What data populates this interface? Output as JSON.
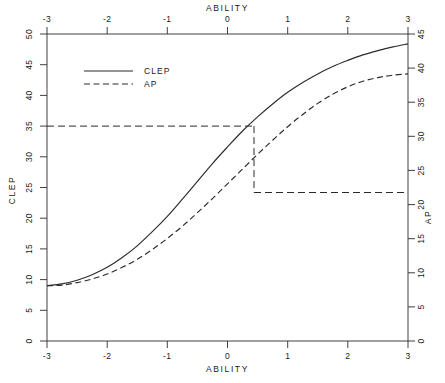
{
  "chart_data": {
    "type": "line",
    "title": "",
    "xlabel": "ABILITY",
    "ylabel": "CLEP",
    "y2label": "AP",
    "xlim": [
      -3,
      3
    ],
    "ylim": [
      0,
      50
    ],
    "y2lim": [
      0,
      45
    ],
    "grid": false,
    "legend_position": "upper-left",
    "x_ticks": [
      "-3",
      "-2",
      "-1",
      "0",
      "1",
      "2",
      "3"
    ],
    "x_tick_values": [
      -3,
      -2,
      -1,
      0,
      1,
      2,
      3
    ],
    "top_xlabel": "ABILITY",
    "top_x_ticks": [
      "-3",
      "-2",
      "-1",
      "0",
      "1",
      "2",
      "3"
    ],
    "y_ticks": [
      "0",
      "5",
      "10",
      "15",
      "20",
      "25",
      "30",
      "35",
      "40",
      "45",
      "50"
    ],
    "y_tick_values": [
      0,
      5,
      10,
      15,
      20,
      25,
      30,
      35,
      40,
      45,
      50
    ],
    "y2_ticks": [
      "0",
      "5",
      "10",
      "15",
      "20",
      "25",
      "30",
      "35",
      "40",
      "45"
    ],
    "y2_tick_values": [
      0,
      5,
      10,
      15,
      20,
      25,
      30,
      35,
      40,
      45
    ],
    "x": [
      -3.0,
      -2.75,
      -2.5,
      -2.25,
      -2.0,
      -1.75,
      -1.5,
      -1.25,
      -1.0,
      -0.75,
      -0.5,
      -0.25,
      0.0,
      0.25,
      0.5,
      0.75,
      1.0,
      1.25,
      1.5,
      1.75,
      2.0,
      2.25,
      2.5,
      2.75,
      3.0
    ],
    "series": [
      {
        "name": "CLEP",
        "style": "solid",
        "axis": "left",
        "values": [
          9.0,
          9.3,
          9.9,
          10.8,
          12.0,
          13.6,
          15.5,
          17.8,
          20.3,
          23.1,
          26.0,
          28.9,
          31.6,
          34.2,
          36.5,
          38.6,
          40.5,
          42.1,
          43.5,
          44.7,
          45.7,
          46.6,
          47.3,
          47.9,
          48.4
        ]
      },
      {
        "name": "AP",
        "style": "dashed",
        "axis": "right",
        "values_on_left_scale": [
          9.0,
          9.1,
          9.5,
          10.1,
          10.9,
          12.0,
          13.3,
          14.9,
          16.7,
          18.7,
          20.9,
          23.2,
          25.6,
          28.0,
          30.4,
          32.7,
          34.9,
          36.9,
          38.7,
          40.2,
          41.4,
          42.3,
          42.9,
          43.3,
          43.5
        ],
        "values": [
          8.1,
          8.2,
          8.6,
          9.1,
          9.8,
          10.8,
          12.0,
          13.4,
          15.0,
          16.8,
          18.8,
          20.9,
          23.0,
          25.2,
          27.4,
          29.4,
          31.4,
          33.2,
          34.8,
          36.2,
          37.3,
          38.1,
          38.6,
          39.0,
          39.2
        ]
      }
    ],
    "legend": [
      {
        "label": "CLEP",
        "style": "solid"
      },
      {
        "label": "AP",
        "style": "dashed"
      }
    ],
    "annotations": {
      "equating_lines": {
        "clep_value": 35,
        "ability_value": 0.45,
        "ap_value": 24,
        "style": "dashed"
      }
    }
  }
}
